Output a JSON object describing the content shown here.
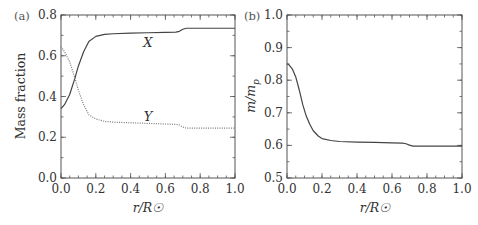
{
  "chart_data": [
    {
      "type": "line",
      "panel_label": "(a)",
      "title": "",
      "xlabel": "r/R☉",
      "ylabel": "Mass fraction",
      "xlim": [
        0.0,
        1.0
      ],
      "ylim": [
        0.0,
        0.8
      ],
      "xticks": [
        "0.0",
        "0.2",
        "0.4",
        "0.6",
        "0.8",
        "1.0"
      ],
      "yticks": [
        "0.0",
        "0.2",
        "0.4",
        "0.6",
        "0.8"
      ],
      "grid": false,
      "legend": "none",
      "series": [
        {
          "name": "X",
          "style": "solid",
          "label_at": [
            0.5,
            0.665
          ],
          "x": [
            0.0,
            0.02,
            0.05,
            0.08,
            0.1,
            0.13,
            0.16,
            0.2,
            0.25,
            0.3,
            0.4,
            0.5,
            0.6,
            0.66,
            0.68,
            0.7,
            0.72,
            0.8,
            0.9,
            1.0
          ],
          "y": [
            0.34,
            0.36,
            0.41,
            0.49,
            0.55,
            0.62,
            0.67,
            0.695,
            0.705,
            0.708,
            0.711,
            0.713,
            0.715,
            0.716,
            0.72,
            0.73,
            0.735,
            0.735,
            0.735,
            0.735
          ]
        },
        {
          "name": "Y",
          "style": "dotted",
          "label_at": [
            0.5,
            0.3
          ],
          "x": [
            0.0,
            0.02,
            0.05,
            0.08,
            0.1,
            0.13,
            0.16,
            0.2,
            0.25,
            0.3,
            0.4,
            0.5,
            0.6,
            0.66,
            0.68,
            0.7,
            0.72,
            0.8,
            0.9,
            1.0
          ],
          "y": [
            0.645,
            0.62,
            0.57,
            0.49,
            0.43,
            0.36,
            0.31,
            0.29,
            0.278,
            0.274,
            0.271,
            0.268,
            0.265,
            0.263,
            0.26,
            0.25,
            0.245,
            0.245,
            0.245,
            0.245
          ]
        }
      ]
    },
    {
      "type": "line",
      "panel_label": "(b)",
      "title": "",
      "xlabel": "r/R☉",
      "ylabel": "m/mp",
      "xlim": [
        0.0,
        1.0
      ],
      "ylim": [
        0.5,
        1.0
      ],
      "xticks": [
        "0.0",
        "0.2",
        "0.4",
        "0.6",
        "0.8",
        "1.0"
      ],
      "yticks": [
        "0.5",
        "0.6",
        "0.7",
        "0.8",
        "0.9",
        "1.0"
      ],
      "grid": false,
      "legend": "none",
      "series": [
        {
          "name": "mean molecular weight",
          "style": "solid",
          "x": [
            0.0,
            0.01,
            0.03,
            0.05,
            0.07,
            0.09,
            0.11,
            0.13,
            0.15,
            0.18,
            0.2,
            0.25,
            0.3,
            0.4,
            0.5,
            0.6,
            0.66,
            0.68,
            0.7,
            0.72,
            0.8,
            0.9,
            1.0
          ],
          "y": [
            0.85,
            0.848,
            0.835,
            0.81,
            0.77,
            0.725,
            0.69,
            0.665,
            0.645,
            0.628,
            0.621,
            0.615,
            0.612,
            0.61,
            0.609,
            0.608,
            0.607,
            0.605,
            0.601,
            0.598,
            0.598,
            0.598,
            0.598
          ]
        }
      ]
    }
  ]
}
